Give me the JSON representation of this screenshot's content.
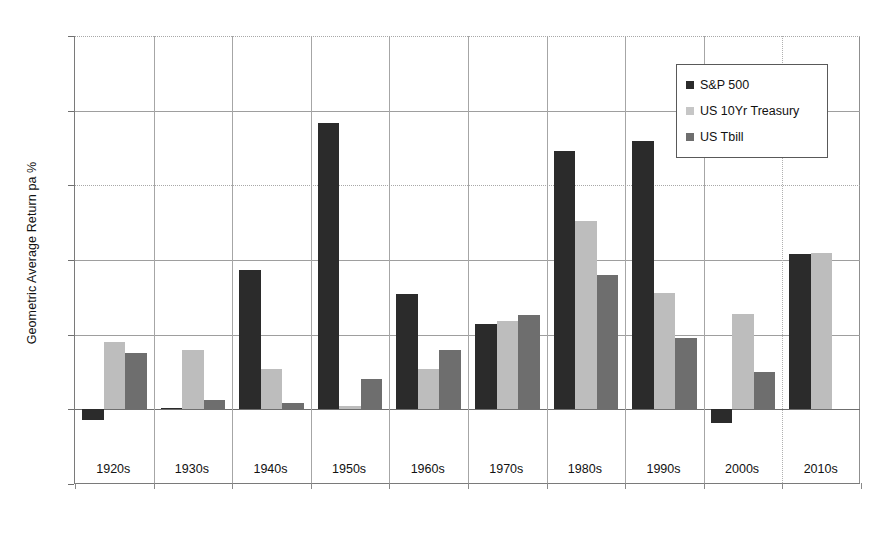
{
  "chart_data": {
    "type": "bar",
    "title": "",
    "xlabel": "",
    "ylabel": "Geometric Average Return pa %",
    "ylim": [
      -5,
      25
    ],
    "yticks": [
      -5,
      0,
      5,
      10,
      15,
      20,
      25
    ],
    "ytick_labels": [
      "-5",
      "0",
      "5",
      "10",
      "15",
      "20",
      "25"
    ],
    "grid": true,
    "legend_position": "top-right",
    "categories": [
      "1920s",
      "1930s",
      "1940s",
      "1950s",
      "1960s",
      "1970s",
      "1980s",
      "1990s",
      "2000s",
      "2010s"
    ],
    "series": [
      {
        "name": "S&P 500",
        "color": "#2b2b2b",
        "values": [
          -0.7,
          0.1,
          9.3,
          19.2,
          7.7,
          5.7,
          17.3,
          18.0,
          -0.9,
          10.4
        ]
      },
      {
        "name": "US 10Yr Treasury",
        "color": "#bdbdbd",
        "values": [
          4.5,
          4.0,
          2.7,
          0.2,
          2.7,
          5.9,
          12.6,
          7.8,
          6.4,
          10.5
        ]
      },
      {
        "name": "US Tbill",
        "color": "#6e6e6e",
        "values": [
          3.8,
          0.6,
          0.4,
          2.0,
          4.0,
          6.3,
          9.0,
          4.8,
          2.5,
          null
        ]
      }
    ]
  },
  "legend": {
    "items": [
      {
        "label": "S&P 500",
        "swatch": "sp"
      },
      {
        "label": "US 10Yr Treasury",
        "swatch": "treas"
      },
      {
        "label": "US Tbill",
        "swatch": "tbill"
      }
    ]
  }
}
